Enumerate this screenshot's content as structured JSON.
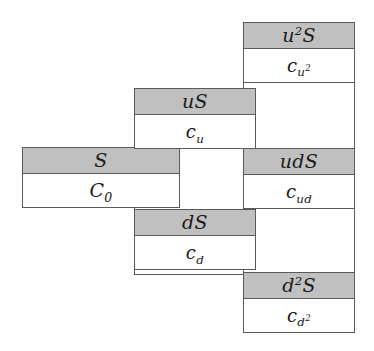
{
  "diagram": {
    "colors": {
      "header_fill": "#c0c0c0",
      "cell_fill": "#ffffff",
      "border": "#5a5a5a",
      "background": "#ffffff",
      "text": "#1b1b1b"
    },
    "nodes": [
      {
        "id": "root",
        "asset_label": "S",
        "asset_parts": {
          "base": "S"
        },
        "option_label": "C0",
        "option_parts": {
          "base": "C",
          "sub": "0"
        },
        "period": 0,
        "path": ""
      },
      {
        "id": "up",
        "asset_label": "uS",
        "asset_parts": {
          "base": "uS"
        },
        "option_label": "cu",
        "option_parts": {
          "base": "c",
          "sub": "u"
        },
        "period": 1,
        "path": "u"
      },
      {
        "id": "down",
        "asset_label": "dS",
        "asset_parts": {
          "base": "dS"
        },
        "option_label": "cd",
        "option_parts": {
          "base": "c",
          "sub": "d"
        },
        "period": 1,
        "path": "d"
      },
      {
        "id": "up-up",
        "asset_label": "u2S",
        "asset_parts": {
          "base": "u",
          "sup": "2",
          "tail": "S"
        },
        "option_label": "cu2",
        "option_parts": {
          "base": "c",
          "sub": "u",
          "sub_sup": "2"
        },
        "period": 2,
        "path": "uu"
      },
      {
        "id": "up-down",
        "asset_label": "udS",
        "asset_parts": {
          "base": "udS"
        },
        "option_label": "cud",
        "option_parts": {
          "base": "c",
          "sub": "ud"
        },
        "period": 2,
        "path": "ud"
      },
      {
        "id": "down-down",
        "asset_label": "d2S",
        "asset_parts": {
          "base": "d",
          "sup": "2",
          "tail": "S"
        },
        "option_label": "cd2",
        "option_parts": {
          "base": "c",
          "sub": "d",
          "sub_sup": "2"
        },
        "period": 2,
        "path": "dd"
      }
    ]
  },
  "text": {
    "s": "S",
    "c0_base": "C",
    "c0_sub": "0",
    "us": "uS",
    "cu_base": "c",
    "cu_sub": "u",
    "ds": "dS",
    "cd_base": "c",
    "cd_sub": "d",
    "u2_base": "u",
    "u2_sup": "2",
    "u2_tail": "S",
    "cu2_base": "c",
    "cu2_sub": "u",
    "cu2_subsup": "2",
    "uds": "udS",
    "cud_base": "c",
    "cud_sub": "ud",
    "d2_base": "d",
    "d2_sup": "2",
    "d2_tail": "S",
    "cd2_base": "c",
    "cd2_sub": "d",
    "cd2_subsup": "2"
  }
}
